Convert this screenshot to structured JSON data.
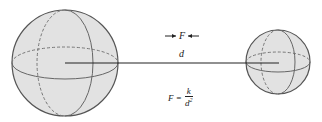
{
  "diagram": {
    "labels": {
      "force": "F",
      "distance": "d",
      "formula_lhs": "F =",
      "formula_numerator": "k",
      "formula_denominator": "d",
      "formula_exponent": "2"
    },
    "spheres": [
      {
        "name": "large-sphere",
        "cx": 65,
        "cy": 63,
        "r": 53
      },
      {
        "name": "small-sphere",
        "cx": 278,
        "cy": 62,
        "r": 32
      }
    ],
    "colors": {
      "sphere_fill": "#e2e2e2",
      "stroke": "#555555",
      "line": "#222222"
    }
  }
}
